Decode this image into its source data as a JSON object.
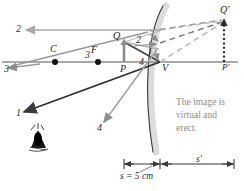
{
  "diagram": {
    "caption_lines": [
      "The image is",
      "virtual and",
      "erect."
    ],
    "points": [
      {
        "id": "C",
        "label": "C",
        "x": 55,
        "y": 62,
        "lx": 50,
        "ly": 46,
        "dot": true
      },
      {
        "id": "F",
        "label": "F",
        "x": 98,
        "y": 62,
        "lx": 91,
        "ly": 47,
        "dot": true
      },
      {
        "id": "Q",
        "label": "Q",
        "x": 124,
        "y": 42,
        "lx": 114,
        "ly": 33,
        "dot": false
      },
      {
        "id": "P",
        "label": "P",
        "x": 124,
        "y": 62,
        "lx": 120,
        "ly": 66,
        "dot": false
      },
      {
        "id": "V",
        "label": "V",
        "x": 160,
        "y": 62,
        "lx": 162,
        "ly": 65,
        "dot": false
      },
      {
        "id": "Qp",
        "label": "Q′",
        "x": 224,
        "y": 20,
        "lx": 221,
        "ly": 7,
        "dot": false
      },
      {
        "id": "Pp",
        "label": "P′",
        "x": 224,
        "y": 62,
        "lx": 222,
        "ly": 65,
        "dot": false
      }
    ],
    "ray_labels": [
      {
        "id": "ray-2-left",
        "text": "2",
        "x": 16,
        "y": 26
      },
      {
        "id": "ray-3-upper",
        "text": "3",
        "x": 86,
        "y": 53
      },
      {
        "id": "ray-3-left",
        "text": "3",
        "x": 5,
        "y": 66
      },
      {
        "id": "ray-2-near",
        "text": "2",
        "x": 137,
        "y": 38
      },
      {
        "id": "ray-1-near",
        "text": "1",
        "x": 148,
        "y": 52
      },
      {
        "id": "ray-4-near",
        "text": "4",
        "x": 140,
        "y": 62
      },
      {
        "id": "ray-1-left",
        "text": "1",
        "x": 17,
        "y": 110
      },
      {
        "id": "ray-4-lower",
        "text": "4",
        "x": 98,
        "y": 126
      }
    ],
    "scale": {
      "s_label": "s = 5 cm",
      "s_prime_label": "s′",
      "s_label_x": 122,
      "s_label_y": 176,
      "s_prime_x": 199,
      "s_prime_y": 156,
      "bar_y": 164,
      "bar_left": 124,
      "bar_mid": 160,
      "bar_right": 234
    },
    "colors": {
      "axis": "#8c8c8c",
      "mirror_stroke": "#3a3a3a",
      "mirror_glow": "#d7d7d7",
      "ray_light": "#a8a8a8",
      "ray_mid": "#8e8e8e",
      "ray_dark": "#4a4a4a",
      "ray_darkest": "#2e2e2e",
      "virtual_dash": "#b5b5b5",
      "caption_text": "#8d8d8d",
      "label_text": "#1a1a1a",
      "dotted_image": "#2b2b2b"
    },
    "caption_pos": {
      "x": 176,
      "y": 99
    },
    "eye_icon": {
      "x": 38,
      "y": 136,
      "name": "observer-eye-icon"
    }
  }
}
